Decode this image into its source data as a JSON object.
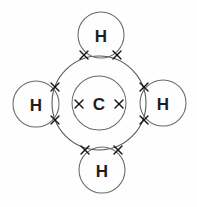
{
  "diagram": {
    "molecule": "CH4",
    "background_color": "#fefefe",
    "line_color": "#58585a",
    "label_color": "#1d1d1f",
    "cross_color": "#141416",
    "central_atom": {
      "symbol": "C",
      "name": "carbon",
      "cx": 99,
      "cy": 103,
      "nucleus_radius": 27,
      "valence_shell_radius": 47
    },
    "outer_atoms": [
      {
        "symbol": "H",
        "name": "hydrogen-top",
        "cx": 101,
        "cy": 35,
        "r": 23
      },
      {
        "symbol": "H",
        "name": "hydrogen-right",
        "cx": 163,
        "cy": 103,
        "r": 23
      },
      {
        "symbol": "H",
        "name": "hydrogen-bottom",
        "cx": 102,
        "cy": 170,
        "r": 23
      },
      {
        "symbol": "H",
        "name": "hydrogen-left",
        "cx": 36,
        "cy": 104,
        "r": 23
      }
    ],
    "crosses": [
      {
        "name": "cross-inner-left",
        "cx": 79,
        "cy": 104,
        "size": 4
      },
      {
        "name": "cross-inner-right",
        "cx": 119,
        "cy": 104,
        "size": 4
      },
      {
        "name": "cross-top-bond-left",
        "cx": 84,
        "cy": 55,
        "size": 4
      },
      {
        "name": "cross-top-bond-right",
        "cx": 117,
        "cy": 55,
        "size": 4
      },
      {
        "name": "cross-bottom-bond-left",
        "cx": 85,
        "cy": 150,
        "size": 4
      },
      {
        "name": "cross-bottom-bond-right",
        "cx": 118,
        "cy": 150,
        "size": 4
      },
      {
        "name": "cross-left-bond-top",
        "cx": 55,
        "cy": 87,
        "size": 4
      },
      {
        "name": "cross-left-bond-bottom",
        "cx": 55,
        "cy": 120,
        "size": 4
      },
      {
        "name": "cross-right-bond-top",
        "cx": 144,
        "cy": 87,
        "size": 4
      },
      {
        "name": "cross-right-bond-bottom",
        "cx": 144,
        "cy": 120,
        "size": 4
      }
    ]
  }
}
